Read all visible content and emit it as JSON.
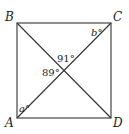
{
  "diagram": {
    "type": "square-with-diagonals",
    "vertices": {
      "A": {
        "label": "A",
        "x": 17,
        "y": 118
      },
      "B": {
        "label": "B",
        "x": 17,
        "y": 23
      },
      "C": {
        "label": "C",
        "x": 111,
        "y": 23
      },
      "D": {
        "label": "D",
        "x": 111,
        "y": 118
      }
    },
    "intersection": {
      "x": 64,
      "y": 70
    },
    "angle_labels": {
      "top": "91°",
      "left": "89°",
      "at_C": "b°",
      "at_A": "a°"
    },
    "colors": {
      "stroke": "#333333",
      "text": "#222222",
      "background": "#ffffff"
    }
  }
}
